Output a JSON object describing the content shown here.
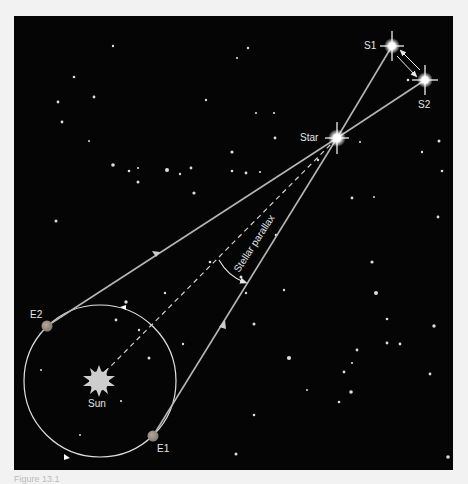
{
  "labels": {
    "s1": "S1",
    "s2": "S2",
    "star": "Star",
    "parallax": "Stellar parallax",
    "e1": "E1",
    "e2": "E2",
    "sun": "Sun"
  },
  "caption": "Figure 13.1",
  "colors": {
    "background": "#050505",
    "page": "#f2f2f2",
    "rays": "#b5b5b5",
    "orbit": "#e0e0e0",
    "earth": "#9a8f86",
    "sun": "#cfcfcf",
    "labels": "#e6e6e6"
  }
}
